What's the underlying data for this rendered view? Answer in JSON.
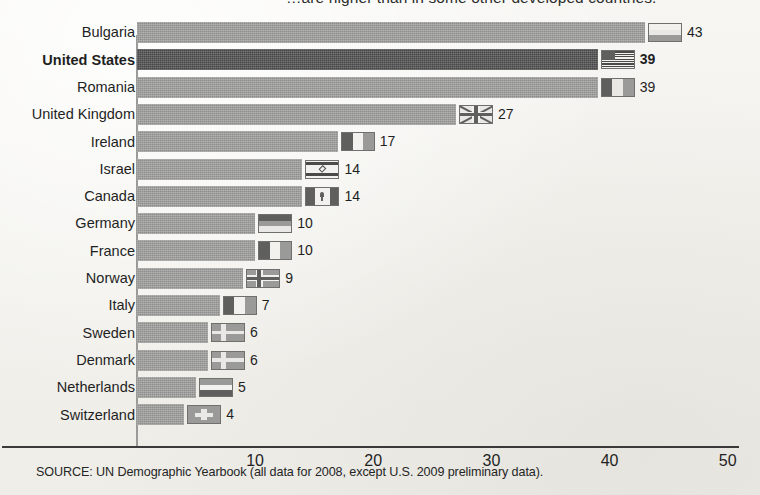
{
  "headline": {
    "cutoff_text": "…are higher than in some other developed countries."
  },
  "source_note": "SOURCE: UN Demographic Yearbook (all data for 2008, except U.S. 2009 preliminary data).",
  "colors": {
    "bar": "#9c9c9a",
    "bar_highlight": "#4e4e4e",
    "axis": "#3a3a3a",
    "page_background": "#f4f3f0",
    "text": "#1f1f1f"
  },
  "axis": {
    "ticks": [
      "10",
      "20",
      "30",
      "40",
      "50"
    ]
  },
  "rows": [
    {
      "label": "Bulgaria",
      "value": "43",
      "flag": "flag-bulgaria",
      "highlight": false
    },
    {
      "label": "United States",
      "value": "39",
      "flag": "flag-united-states",
      "highlight": true
    },
    {
      "label": "Romania",
      "value": "39",
      "flag": "flag-romania",
      "highlight": false
    },
    {
      "label": "United Kingdom",
      "value": "27",
      "flag": "flag-united-kingdom",
      "highlight": false
    },
    {
      "label": "Ireland",
      "value": "17",
      "flag": "flag-ireland",
      "highlight": false
    },
    {
      "label": "Israel",
      "value": "14",
      "flag": "flag-israel",
      "highlight": false
    },
    {
      "label": "Canada",
      "value": "14",
      "flag": "flag-canada",
      "highlight": false
    },
    {
      "label": "Germany",
      "value": "10",
      "flag": "flag-germany",
      "highlight": false
    },
    {
      "label": "France",
      "value": "10",
      "flag": "flag-france",
      "highlight": false
    },
    {
      "label": "Norway",
      "value": "9",
      "flag": "flag-norway",
      "highlight": false
    },
    {
      "label": "Italy",
      "value": "7",
      "flag": "flag-italy",
      "highlight": false
    },
    {
      "label": "Sweden",
      "value": "6",
      "flag": "flag-sweden",
      "highlight": false
    },
    {
      "label": "Denmark",
      "value": "6",
      "flag": "flag-denmark",
      "highlight": false
    },
    {
      "label": "Netherlands",
      "value": "5",
      "flag": "flag-netherlands",
      "highlight": false
    },
    {
      "label": "Switzerland",
      "value": "4",
      "flag": "flag-switzerland",
      "highlight": false
    }
  ],
  "chart_data": {
    "type": "bar",
    "orientation": "horizontal",
    "title": "…are higher than in some other developed countries.",
    "xlabel": "",
    "ylabel": "",
    "xlim": [
      0,
      50
    ],
    "grid": false,
    "legend": null,
    "categories": [
      "Bulgaria",
      "United States",
      "Romania",
      "United Kingdom",
      "Ireland",
      "Israel",
      "Canada",
      "Germany",
      "France",
      "Norway",
      "Italy",
      "Sweden",
      "Denmark",
      "Netherlands",
      "Switzerland"
    ],
    "values": [
      43,
      39,
      39,
      27,
      17,
      14,
      14,
      10,
      10,
      9,
      7,
      6,
      6,
      5,
      4
    ],
    "data_labels": [
      "43",
      "39",
      "39",
      "27",
      "17",
      "14",
      "14",
      "10",
      "10",
      "9",
      "7",
      "6",
      "6",
      "5",
      "4"
    ],
    "highlighted_category": "United States",
    "tick_labels": [
      "10",
      "20",
      "30",
      "40",
      "50"
    ],
    "annotations": [
      "SOURCE: UN Demographic Yearbook (all data for 2008, except U.S. 2009 preliminary data)."
    ]
  }
}
